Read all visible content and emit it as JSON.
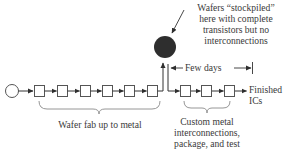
{
  "diagram": {
    "annotations": {
      "stockpile_line1": "Wafers “stockpiled”",
      "stockpile_line2": "here with complete",
      "stockpile_line3": "transistors but no",
      "stockpile_line4": "interconnections",
      "few_days": "Few days",
      "finished_line1": "Finished",
      "finished_line2": "ICs",
      "fab_label": "Wafer fab up to metal",
      "custom_line1": "Custom metal",
      "custom_line2": "interconnections,",
      "custom_line3": "package, and test"
    },
    "nodes": {
      "start": "start-circle",
      "fab_steps": 6,
      "stockpile": "stockpile-circle",
      "custom_steps": 3
    },
    "colors": {
      "line": "#3a3a3a",
      "stockpile_fill": "#2e2e2e",
      "box_stroke": "#555555",
      "brace": "#8a8a8a"
    }
  }
}
